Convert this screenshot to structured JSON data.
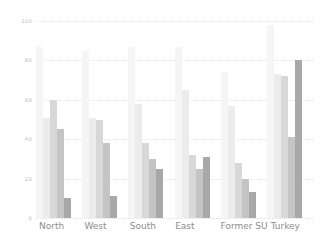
{
  "chart_data": {
    "type": "bar",
    "title": "",
    "subtitle": "",
    "xlabel": "",
    "ylabel": "",
    "ylim": [
      0,
      100
    ],
    "yticks": [
      0,
      20,
      40,
      60,
      80,
      100
    ],
    "ytick_labels": [
      "0",
      "20",
      "40",
      "60",
      "80",
      "100"
    ],
    "grid": true,
    "legend": false,
    "legend_position": "none",
    "categories": [
      "North",
      "West",
      "South",
      "East",
      "Former SU",
      "Turkey"
    ],
    "series": [
      {
        "name": "Series 1",
        "color": "#f5f5f5",
        "values": [
          87,
          85,
          87,
          87,
          74,
          98
        ]
      },
      {
        "name": "Series 2",
        "color": "#ececec",
        "values": [
          51,
          51,
          58,
          65,
          57,
          73
        ]
      },
      {
        "name": "Series 3",
        "color": "#d8d8d8",
        "values": [
          60,
          50,
          38,
          32,
          28,
          72
        ]
      },
      {
        "name": "Series 4",
        "color": "#c4c4c4",
        "values": [
          45,
          38,
          30,
          25,
          20,
          41
        ]
      },
      {
        "name": "Series 5",
        "color": "#a8a8a8",
        "values": [
          10,
          11,
          25,
          31,
          13,
          80
        ]
      }
    ]
  },
  "axis": {
    "gridline_color": "#e3e3e3",
    "tick_text_color": "#b9b9b9",
    "label_text_color": "#8d8d8d"
  },
  "background": "#ffffff"
}
